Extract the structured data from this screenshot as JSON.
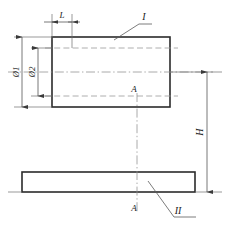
{
  "drawing": {
    "title": "Two-part assembly section drawing",
    "background_color": "#ffffff",
    "line_color": "#2b2b2b",
    "thin_line_color": "#6f6f6f",
    "hidden_line_color": "#9a9a9a",
    "center_line_color": "#8d8d8d"
  },
  "labels": {
    "length_L": "L",
    "diameter_1": "Ø1",
    "diameter_2": "Ø2",
    "part_one": "I",
    "part_two": "II",
    "height_H": "H",
    "section_mark_top": "A",
    "section_mark_bottom": "A"
  },
  "parts": [
    {
      "id": "part-I",
      "label": "I",
      "shape": "rectangle",
      "description": "Upper block shown in section with hidden bore lines",
      "x": 52,
      "y": 37,
      "width": 118,
      "height": 70
    },
    {
      "id": "part-II",
      "label": "II",
      "shape": "rectangle",
      "description": "Lower plate",
      "x": 22,
      "y": 172,
      "width": 173,
      "height": 20
    }
  ],
  "dimensions": [
    {
      "name": "L",
      "label": "L",
      "orientation": "horizontal",
      "position": "top",
      "from_x": 52,
      "to_x": 72,
      "y": 22
    },
    {
      "name": "D1",
      "label": "Ø1",
      "orientation": "vertical",
      "position": "left-outer",
      "x": 22,
      "from_y": 37,
      "to_y": 107
    },
    {
      "name": "D2",
      "label": "Ø2",
      "orientation": "vertical",
      "position": "left-inner",
      "x": 38,
      "from_y": 48,
      "to_y": 96
    },
    {
      "name": "H",
      "label": "H",
      "orientation": "vertical",
      "position": "right",
      "x": 207,
      "from_y": 72,
      "to_y": 192
    }
  ],
  "section": {
    "name": "A-A",
    "label_top": "A",
    "label_bottom": "A",
    "axis_x": 137,
    "from_y": 93,
    "to_y": 212
  }
}
